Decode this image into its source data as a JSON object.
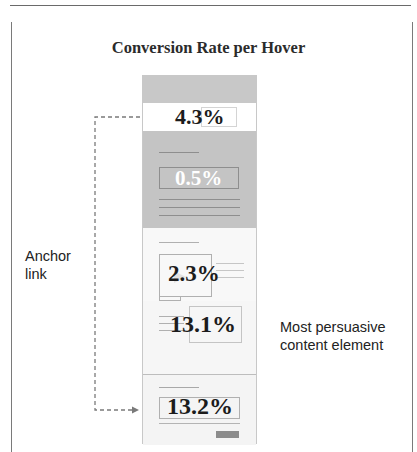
{
  "figure": {
    "title": "Conversion Rate per Hover",
    "sections": [
      {
        "name": "page-header",
        "value": ""
      },
      {
        "name": "anchor-link-bar",
        "value": "4.3%"
      },
      {
        "name": "hero-block",
        "value": "0.5%"
      },
      {
        "name": "image-text-block",
        "value": "2.3%"
      },
      {
        "name": "persuasive-content-block",
        "value": "13.1%"
      },
      {
        "name": "bottom-cta-block",
        "value": "13.2%"
      }
    ],
    "annotations": {
      "left_label": "Anchor\nlink",
      "left_label_line1": "Anchor",
      "left_label_line2": "link",
      "right_label_line1": "Most persuasive",
      "right_label_line2": "content element"
    },
    "colors": {
      "gray_block": "#c4c4c4",
      "arrow": "#7a7a7a",
      "text": "#1c1c1c"
    }
  }
}
